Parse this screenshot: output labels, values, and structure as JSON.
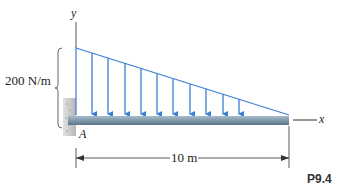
{
  "diagram": {
    "load_label": "200 N/m",
    "length_label": "10 m",
    "point_label": "A",
    "x_axis_label": "x",
    "y_axis_label": "y",
    "figure_id": "P9.4",
    "arrow_count": 10,
    "colors": {
      "load": "#3a7fd5",
      "beam": "#7f98aa",
      "wall": "#c8c8c8",
      "line": "#333333"
    }
  }
}
